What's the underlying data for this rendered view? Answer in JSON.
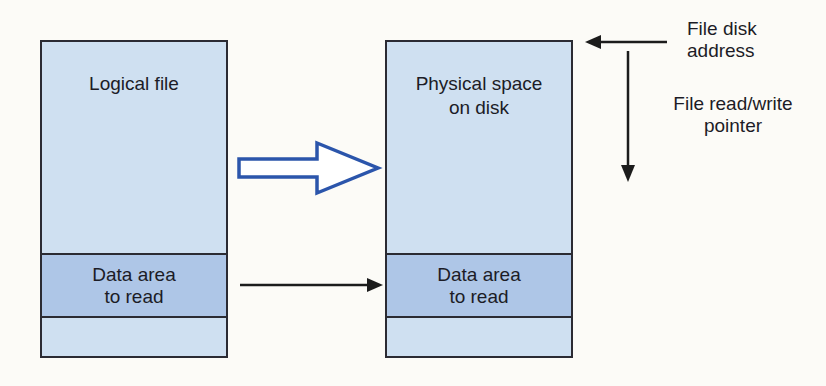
{
  "diagram": {
    "colors": {
      "background": "#fcfbf7",
      "box_fill": "#cfe0f1",
      "band_fill": "#aec6e7",
      "box_border": "#2b2b33",
      "blue_arrow": "#2b55ab",
      "black_arrow": "#1c1c1c",
      "text": "#1c1c26"
    },
    "logical_box": {
      "title": "Logical file",
      "band_line1": "Data area",
      "band_line2": "to read"
    },
    "physical_box": {
      "title_line1": "Physical space",
      "title_line2": "on disk",
      "band_line1": "Data area",
      "band_line2": "to read"
    },
    "labels": {
      "disk_address_line1": "File disk",
      "disk_address_line2": "address",
      "rw_pointer_line1": "File read/write",
      "rw_pointer_line2": "pointer"
    }
  }
}
